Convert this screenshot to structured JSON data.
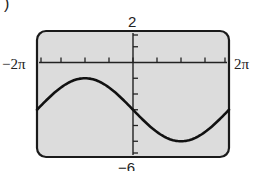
{
  "header": {
    "partial_label": ")"
  },
  "chart_data": {
    "type": "line",
    "title": "",
    "xlabel": "",
    "ylabel": "",
    "xlim_labels": [
      "−2π",
      "2π"
    ],
    "ylim_labels": [
      "−6",
      "2"
    ],
    "xlim": [
      -6.2832,
      6.2832
    ],
    "ylim": [
      -6,
      2
    ],
    "x_tick_step": 1.5708,
    "y_tick_step": 1,
    "grid": false,
    "legend": null,
    "series": [
      {
        "name": "y = -3 - 2 sin(x/2)",
        "x": [
          -6.2832,
          -4.7124,
          -3.1416,
          -1.5708,
          0,
          1.5708,
          3.1416,
          4.7124,
          6.2832
        ],
        "y": [
          -3,
          -1.59,
          -1,
          -1.59,
          -3,
          -4.41,
          -5,
          -4.41,
          -3
        ]
      }
    ]
  },
  "labels": {
    "x_min": "−2π",
    "x_max": "2π",
    "y_max": "2",
    "y_min": "−6"
  },
  "colors": {
    "screen": "#dcdcdc",
    "frame": "#1a1a1a",
    "curve": "#111111"
  }
}
